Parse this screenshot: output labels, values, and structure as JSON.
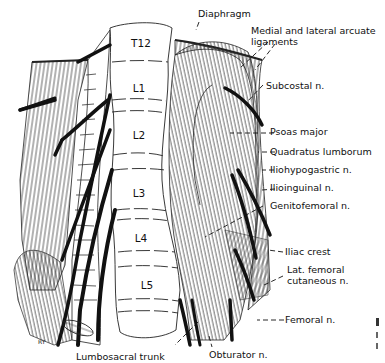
{
  "figure": {
    "type": "anatomical illustration",
    "signature": "RY",
    "colors": {
      "ink": "#111111",
      "background": "#ffffff"
    }
  },
  "vertebrae": [
    {
      "label": "T12"
    },
    {
      "label": "L1"
    },
    {
      "label": "L2"
    },
    {
      "label": "L3"
    },
    {
      "label": "L4"
    },
    {
      "label": "L5"
    }
  ],
  "labels": {
    "diaphragm": "Diaphragm",
    "arcuate_line1": "Medial and lateral arcuate",
    "arcuate_line2": "ligaments",
    "subcostal": "Subcostal n.",
    "psoas": "Psoas major",
    "quadratus": "Quadratus lumborum",
    "iliohypogastric": "Iliohypogastric n.",
    "ilioinguinal": "Ilioinguinal n.",
    "genitofemoral": "Genitofemoral n.",
    "iliac_crest": "Iliac crest",
    "lat_fem_line1": "Lat. femoral",
    "lat_fem_line2": "cutaneous n.",
    "femoral": "Femoral n.",
    "obturator": "Obturator n.",
    "lumbosacral": "Lumbosacral trunk"
  }
}
